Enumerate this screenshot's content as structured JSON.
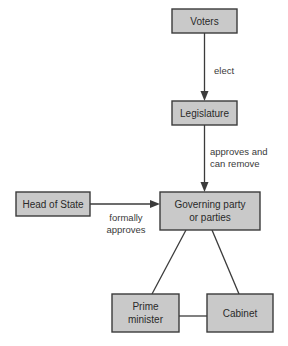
{
  "diagram": {
    "type": "flow-diagram",
    "colors": {
      "node_fill": "#c9c9c9",
      "node_stroke": "#3b3b3b",
      "edge_stroke": "#3b3b3b",
      "label_text": "#3a3a3a",
      "background": "#ffffff"
    },
    "nodes": [
      {
        "id": "voters",
        "label": "Voters",
        "lines": [
          "Voters"
        ],
        "x": 172,
        "y": 9,
        "w": 65,
        "h": 24
      },
      {
        "id": "legislature",
        "label": "Legislature",
        "lines": [
          "Legislature"
        ],
        "x": 172,
        "y": 101,
        "w": 65,
        "h": 24
      },
      {
        "id": "governing-party",
        "label": "Governing party or parties",
        "lines": [
          "Governing party",
          "or parties"
        ],
        "x": 160,
        "y": 192,
        "w": 100,
        "h": 38
      },
      {
        "id": "head-of-state",
        "label": "Head of State",
        "lines": [
          "Head of State"
        ],
        "x": 16,
        "y": 192,
        "w": 74,
        "h": 24
      },
      {
        "id": "prime-minister",
        "label": "Prime minister",
        "lines": [
          "Prime",
          "minister"
        ],
        "x": 112,
        "y": 294,
        "w": 67,
        "h": 38
      },
      {
        "id": "cabinet",
        "label": "Cabinet",
        "lines": [
          "Cabinet"
        ],
        "x": 207,
        "y": 294,
        "w": 66,
        "h": 38
      }
    ],
    "edges": [
      {
        "id": "voters-to-legislature",
        "from": "voters",
        "to": "legislature",
        "label_lines": [
          "elect"
        ],
        "arrow": true,
        "label_x": 209,
        "label_y": 71
      },
      {
        "id": "legislature-to-governing-party",
        "from": "legislature",
        "to": "governing-party",
        "label_lines": [
          "approves and",
          "can remove"
        ],
        "arrow": true,
        "label_x": 209,
        "label_y": 155
      },
      {
        "id": "head-of-state-to-governing-party",
        "from": "head-of-state",
        "to": "governing-party",
        "label_lines": [
          "formally",
          "approves"
        ],
        "arrow": true,
        "label_x": 126,
        "label_y": 222
      },
      {
        "id": "governing-party-to-prime-minister",
        "from": "governing-party",
        "to": "prime-minister",
        "label_lines": [],
        "arrow": false
      },
      {
        "id": "governing-party-to-cabinet",
        "from": "governing-party",
        "to": "cabinet",
        "label_lines": [],
        "arrow": false
      },
      {
        "id": "prime-minister-to-cabinet",
        "from": "prime-minister",
        "to": "cabinet",
        "label_lines": [],
        "arrow": false
      }
    ]
  }
}
